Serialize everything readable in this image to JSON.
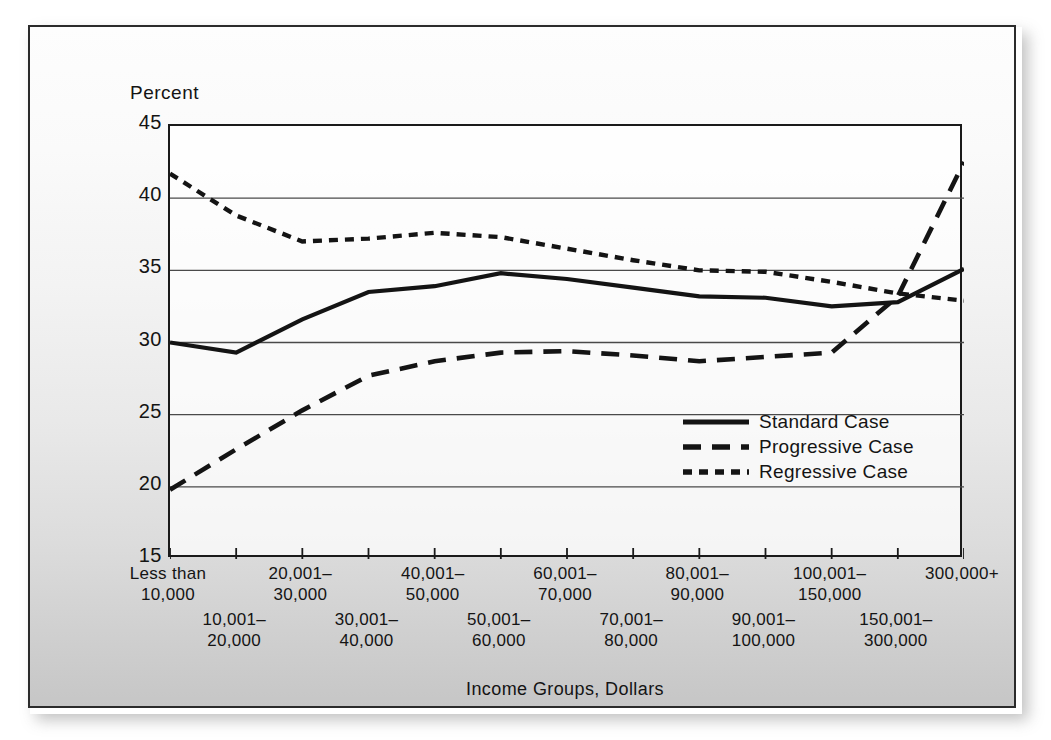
{
  "figure": {
    "y_axis_title": "Percent",
    "x_axis_title": "Income Groups, Dollars"
  },
  "legend": {
    "items": [
      {
        "label": "Standard Case",
        "style": "solid",
        "icon": "solid-line-icon"
      },
      {
        "label": "Progressive Case",
        "style": "long-dash",
        "icon": "dashed-line-icon"
      },
      {
        "label": "Regressive Case",
        "style": "short-dash",
        "icon": "dotted-line-icon"
      }
    ]
  },
  "yticks": [
    "45",
    "40",
    "35",
    "30",
    "25",
    "20",
    "15"
  ],
  "xgroups_top": [
    {
      "line1": "Less than",
      "line2": "10,000"
    },
    {
      "line1": "20,001–",
      "line2": "30,000"
    },
    {
      "line1": "40,001–",
      "line2": "50,000"
    },
    {
      "line1": "60,001–",
      "line2": "70,000"
    },
    {
      "line1": "80,001–",
      "line2": "90,000"
    },
    {
      "line1": "100,001–",
      "line2": "150,000"
    },
    {
      "line1": "300,000+",
      "line2": ""
    }
  ],
  "xgroups_bottom": [
    {
      "line1": "10,001–",
      "line2": "20,000"
    },
    {
      "line1": "30,001–",
      "line2": "40,000"
    },
    {
      "line1": "50,001–",
      "line2": "60,000"
    },
    {
      "line1": "70,001–",
      "line2": "80,000"
    },
    {
      "line1": "90,001–",
      "line2": "100,000"
    },
    {
      "line1": "150,001–",
      "line2": "300,000"
    }
  ],
  "colors": {
    "ink": "#141414",
    "frame": "#1a1a1a",
    "gridline": "#4a4a4a",
    "plot_background": "#ffffff"
  },
  "chart_data": {
    "type": "line",
    "title": "",
    "xlabel": "Income Groups, Dollars",
    "ylabel": "Percent",
    "ylim": [
      15,
      45
    ],
    "yticks": [
      15,
      20,
      25,
      30,
      35,
      40,
      45
    ],
    "grid": "horizontal",
    "legend_position": "inside-lower-right",
    "categories": [
      "Less than 10,000",
      "10,001–20,000",
      "20,001–30,000",
      "30,001–40,000",
      "40,001–50,000",
      "50,001–60,000",
      "60,001–70,000",
      "70,001–80,000",
      "80,001–90,000",
      "90,001–100,000",
      "100,001–150,000",
      "150,001–300,000",
      "300,000+"
    ],
    "series": [
      {
        "name": "Standard Case",
        "style": "solid",
        "values": [
          30.0,
          29.3,
          31.6,
          33.5,
          33.9,
          34.8,
          34.4,
          33.8,
          33.2,
          33.1,
          32.5,
          32.8,
          35.1
        ]
      },
      {
        "name": "Progressive Case",
        "style": "long-dash",
        "values": [
          19.8,
          22.6,
          25.3,
          27.7,
          28.7,
          29.3,
          29.4,
          29.1,
          28.7,
          29.0,
          29.3,
          33.2,
          42.5
        ]
      },
      {
        "name": "Regressive Case",
        "style": "short-dash",
        "values": [
          41.7,
          38.8,
          37.0,
          37.2,
          37.6,
          37.3,
          36.5,
          35.7,
          35.0,
          34.9,
          34.2,
          33.4,
          32.9
        ]
      }
    ]
  }
}
